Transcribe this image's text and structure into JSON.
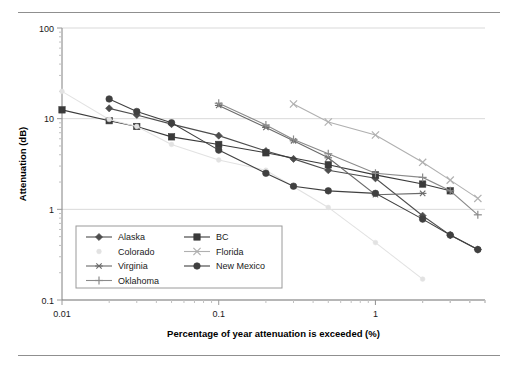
{
  "figure": {
    "has_top_rule": true,
    "has_bottom_rule": true
  },
  "chart_data": {
    "type": "line",
    "title": "",
    "xlabel": "Percentage of year attenuation is exceeded (%)",
    "ylabel": "Attenuation (dB)",
    "xscale": "log",
    "yscale": "log",
    "xlim": [
      0.01,
      5
    ],
    "ylim": [
      0.1,
      100
    ],
    "xticks": [
      0.01,
      0.1,
      1
    ],
    "xticklabels": [
      "0.01",
      "0.1",
      "1"
    ],
    "yticks": [
      0.1,
      1,
      10,
      100
    ],
    "yticklabels": [
      "0.1",
      "1",
      "10",
      "100"
    ],
    "grid": "horizontal-major",
    "legend_position": "lower-left-inside",
    "series": [
      {
        "name": "Alaska",
        "marker": "diamond",
        "color": "#4d4d4d",
        "points": [
          [
            0.02,
            13.0
          ],
          [
            0.03,
            11.0
          ],
          [
            0.05,
            8.7
          ],
          [
            0.1,
            6.5
          ],
          [
            0.2,
            4.4
          ],
          [
            0.3,
            3.6
          ],
          [
            0.5,
            2.7
          ],
          [
            1.0,
            2.2
          ],
          [
            2.0,
            0.85
          ],
          [
            3.0,
            0.52
          ],
          [
            4.5,
            0.36
          ]
        ]
      },
      {
        "name": "BC",
        "marker": "square",
        "color": "#3a3a3a",
        "points": [
          [
            0.01,
            12.5
          ],
          [
            0.02,
            9.5
          ],
          [
            0.03,
            8.2
          ],
          [
            0.05,
            6.3
          ],
          [
            0.1,
            5.2
          ],
          [
            0.2,
            4.2
          ],
          [
            0.5,
            3.1
          ],
          [
            1.0,
            2.4
          ],
          [
            2.0,
            1.9
          ],
          [
            3.0,
            1.6
          ]
        ]
      },
      {
        "name": "Colorado",
        "marker": "dot-faint",
        "color": "#e2e2e2",
        "points": [
          [
            0.01,
            20.0
          ],
          [
            0.02,
            9.8
          ],
          [
            0.03,
            8.2
          ],
          [
            0.05,
            5.2
          ],
          [
            0.1,
            3.5
          ],
          [
            0.2,
            2.7
          ],
          [
            0.5,
            1.05
          ],
          [
            1.0,
            0.43
          ],
          [
            2.0,
            0.17
          ]
        ]
      },
      {
        "name": "Florida",
        "marker": "cross-x",
        "color": "#b0b0b0",
        "points": [
          [
            0.3,
            14.5
          ],
          [
            0.5,
            9.2
          ],
          [
            1.0,
            6.6
          ],
          [
            2.0,
            3.3
          ],
          [
            3.0,
            2.1
          ],
          [
            4.5,
            1.32
          ]
        ]
      },
      {
        "name": "Virginia",
        "marker": "asterisk",
        "color": "#6a6a6a",
        "points": [
          [
            0.1,
            14.0
          ],
          [
            0.2,
            8.0
          ],
          [
            0.3,
            5.7
          ],
          [
            0.5,
            3.7
          ],
          [
            1.0,
            1.45
          ],
          [
            2.0,
            1.5
          ]
        ]
      },
      {
        "name": "New Mexico",
        "marker": "circle",
        "color": "#404040",
        "points": [
          [
            0.02,
            16.5
          ],
          [
            0.03,
            12.0
          ],
          [
            0.05,
            9.0
          ],
          [
            0.1,
            4.5
          ],
          [
            0.2,
            2.5
          ],
          [
            0.3,
            1.8
          ],
          [
            0.5,
            1.6
          ],
          [
            1.0,
            1.5
          ],
          [
            2.0,
            0.78
          ],
          [
            3.0,
            0.52
          ],
          [
            4.5,
            0.36
          ]
        ]
      },
      {
        "name": "Oklahoma",
        "marker": "plus",
        "color": "#8a8a8a",
        "points": [
          [
            0.1,
            14.8
          ],
          [
            0.2,
            8.5
          ],
          [
            0.3,
            5.9
          ],
          [
            0.5,
            4.1
          ],
          [
            1.0,
            2.5
          ],
          [
            2.0,
            2.25
          ],
          [
            3.0,
            1.6
          ],
          [
            4.5,
            0.87
          ]
        ]
      }
    ],
    "legend_entries": [
      {
        "label": "Alaska",
        "marker": "diamond",
        "color": "#4d4d4d"
      },
      {
        "label": "BC",
        "marker": "square",
        "color": "#3a3a3a"
      },
      {
        "label": "Colorado",
        "marker": "dot-faint",
        "color": "#e2e2e2"
      },
      {
        "label": "Florida",
        "marker": "cross-x",
        "color": "#b0b0b0"
      },
      {
        "label": "Virginia",
        "marker": "asterisk",
        "color": "#6a6a6a"
      },
      {
        "label": "New Mexico",
        "marker": "circle",
        "color": "#404040"
      },
      {
        "label": "Oklahoma",
        "marker": "plus",
        "color": "#8a8a8a"
      }
    ]
  }
}
